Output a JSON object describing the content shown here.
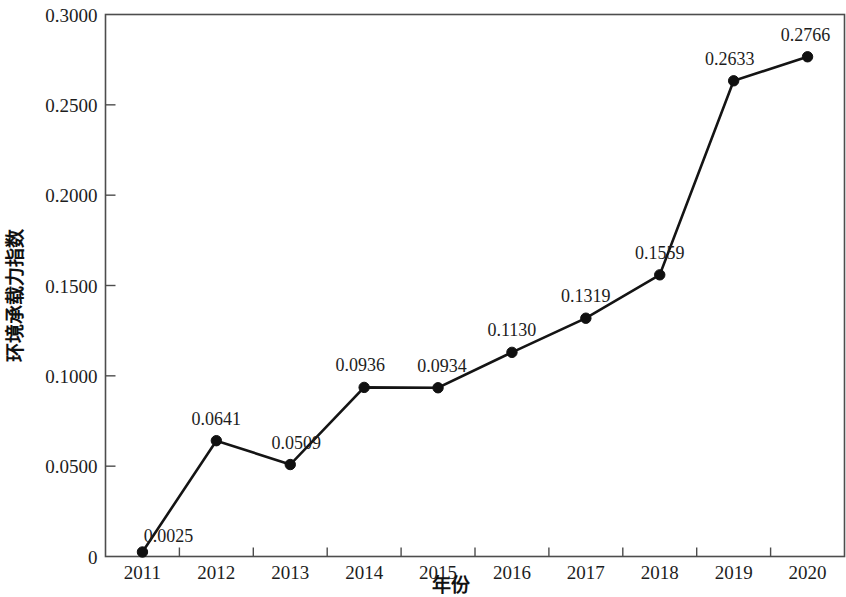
{
  "chart_data": {
    "type": "line",
    "title": "",
    "subtitle": "",
    "xlabel": "年份",
    "ylabel": "环境承载力指数",
    "categories": [
      "2011",
      "2012",
      "2013",
      "2014",
      "2015",
      "2016",
      "2017",
      "2018",
      "2019",
      "2020"
    ],
    "x": [
      2011,
      2012,
      2013,
      2014,
      2015,
      2016,
      2017,
      2018,
      2019,
      2020
    ],
    "values": [
      0.0025,
      0.0641,
      0.0509,
      0.0936,
      0.0934,
      0.113,
      0.1319,
      0.1559,
      0.2633,
      0.2766
    ],
    "point_labels": [
      "0.0025",
      "0.0641",
      "0.0509",
      "0.0936",
      "0.0934",
      "0.1130",
      "0.1319",
      "0.1559",
      "0.2633",
      "0.2766"
    ],
    "series": [
      {
        "name": "环境承载力指数",
        "values": [
          0.0025,
          0.0641,
          0.0509,
          0.0936,
          0.0934,
          0.113,
          0.1319,
          0.1559,
          0.2633,
          0.2766
        ]
      }
    ],
    "ylim": [
      0,
      0.3
    ],
    "xlim": [
      2011,
      2020
    ],
    "y_ticks": [
      0,
      0.05,
      0.1,
      0.15,
      0.2,
      0.25,
      0.3
    ],
    "y_tick_labels": [
      "0",
      "0.0500",
      "0.1000",
      "0.1500",
      "0.2000",
      "0.2500",
      "0.3000"
    ],
    "x_tick_labels": [
      "2011",
      "2012",
      "2013",
      "2014",
      "2015",
      "2016",
      "2017",
      "2018",
      "2019",
      "2020"
    ],
    "grid": false,
    "legend": false,
    "legend_position": "none",
    "marker": "circle",
    "line_color": "#141414",
    "marker_color": "#101010",
    "axis_color": "#4d4d4d",
    "background_color": "#ffffff"
  }
}
